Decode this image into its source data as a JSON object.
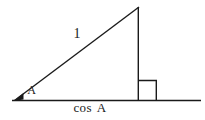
{
  "diagram": {
    "background_color": "#ffffff",
    "line_color": "#1a1a1a",
    "labels": {
      "hypotenuse_length": "1",
      "angle": "A",
      "base_length": "cos A"
    }
  }
}
